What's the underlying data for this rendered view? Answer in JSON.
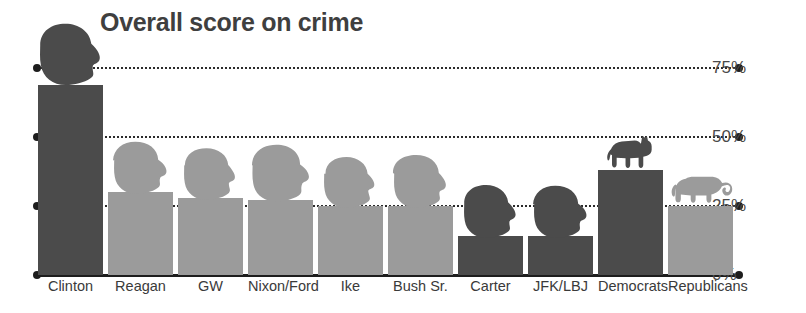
{
  "chart_data": {
    "type": "bar",
    "title": "Overall score on crime",
    "xlabel": "",
    "ylabel": "",
    "ylim": [
      0,
      80
    ],
    "grid": true,
    "legend": "none",
    "yticks": [
      "0%",
      "25%",
      "50%",
      "75%"
    ],
    "ytick_values": [
      0,
      25,
      50,
      75
    ],
    "categories": [
      "Clinton",
      "Reagan",
      "GW",
      "Nixon/Ford",
      "Ike",
      "Bush Sr.",
      "Carter",
      "JFK/LBJ",
      "Democrats",
      "Republicans"
    ],
    "values": [
      69,
      30,
      28,
      27,
      25,
      25,
      14,
      14,
      38,
      25
    ],
    "bar_shades": [
      "dark",
      "light",
      "light",
      "light",
      "light",
      "light",
      "dark",
      "dark",
      "dark",
      "light"
    ],
    "marker_icons": [
      "head-clinton",
      "head-reagan",
      "head-gw",
      "head-nixon-ford",
      "head-ike",
      "head-bush-sr",
      "head-carter",
      "head-jfk-lbj",
      "donkey",
      "elephant"
    ],
    "colors": {
      "bar_dark": "#4b4b4b",
      "bar_light": "#9b9b9b",
      "axis": "#1d1d1d",
      "title": "#3f3f3f",
      "label": "#3a3a3a",
      "background": "#ffffff"
    }
  }
}
